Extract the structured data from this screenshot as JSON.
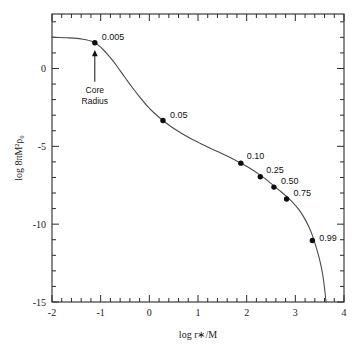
{
  "chart_data": {
    "type": "line",
    "title": "",
    "xlabel": "log r∗/M",
    "ylabel": "log 8πM²ρ₀",
    "xlim": [
      -2,
      4
    ],
    "ylim": [
      -15,
      3.5
    ],
    "grid": false,
    "legend": "none",
    "x_major_ticks": [
      -2,
      -1,
      0,
      1,
      2,
      3,
      4
    ],
    "x_major_tick_labels": [
      "-2",
      "-1",
      "0",
      "1",
      "2",
      "3",
      "4"
    ],
    "x_minor_subdivisions": 5,
    "y_major_ticks": [
      0,
      -5,
      -10,
      -15
    ],
    "y_major_tick_labels": [
      "0",
      "-5",
      "-10",
      "-15"
    ],
    "y_minor_subdivisions": 5,
    "curve_points": [
      [
        -2.0,
        2.0
      ],
      [
        -1.85,
        1.99
      ],
      [
        -1.7,
        1.97
      ],
      [
        -1.55,
        1.95
      ],
      [
        -1.4,
        1.9
      ],
      [
        -1.3,
        1.85
      ],
      [
        -1.2,
        1.76
      ],
      [
        -1.12,
        1.65
      ],
      [
        -1.05,
        1.5
      ],
      [
        -0.95,
        1.22
      ],
      [
        -0.85,
        0.88
      ],
      [
        -0.75,
        0.5
      ],
      [
        -0.65,
        0.08
      ],
      [
        -0.55,
        -0.36
      ],
      [
        -0.45,
        -0.8
      ],
      [
        -0.35,
        -1.22
      ],
      [
        -0.2,
        -1.82
      ],
      [
        -0.05,
        -2.38
      ],
      [
        0.1,
        -2.86
      ],
      [
        0.28,
        -3.34
      ],
      [
        0.45,
        -3.74
      ],
      [
        0.65,
        -4.14
      ],
      [
        0.85,
        -4.5
      ],
      [
        1.05,
        -4.82
      ],
      [
        1.25,
        -5.12
      ],
      [
        1.45,
        -5.4
      ],
      [
        1.65,
        -5.7
      ],
      [
        1.88,
        -6.08
      ],
      [
        2.05,
        -6.38
      ],
      [
        2.28,
        -6.85
      ],
      [
        2.45,
        -7.25
      ],
      [
        2.56,
        -7.55
      ],
      [
        2.7,
        -7.9
      ],
      [
        2.82,
        -8.22
      ],
      [
        2.95,
        -8.62
      ],
      [
        3.08,
        -9.1
      ],
      [
        3.18,
        -9.58
      ],
      [
        3.28,
        -10.18
      ],
      [
        3.35,
        -10.72
      ],
      [
        3.42,
        -11.4
      ],
      [
        3.5,
        -12.3
      ],
      [
        3.56,
        -13.2
      ],
      [
        3.6,
        -14.1
      ],
      [
        3.63,
        -15.0
      ]
    ],
    "points": [
      {
        "label": "0.005",
        "x": -1.12,
        "y": 1.65,
        "label_dx": 7,
        "label_dy": -3
      },
      {
        "label": "0.05",
        "x": 0.28,
        "y": -3.34,
        "label_dx": 7,
        "label_dy": -2
      },
      {
        "label": "0.10",
        "x": 1.88,
        "y": -6.08,
        "label_dx": 6,
        "label_dy": -4
      },
      {
        "label": "0.25",
        "x": 2.28,
        "y": -6.95,
        "label_dx": 6,
        "label_dy": -4
      },
      {
        "label": "0.50",
        "x": 2.56,
        "y": -7.62,
        "label_dx": 7,
        "label_dy": -3
      },
      {
        "label": "0.75",
        "x": 2.82,
        "y": -8.38,
        "label_dx": 7,
        "label_dy": -3
      },
      {
        "label": "0.99",
        "x": 3.35,
        "y": -11.05,
        "label_dx": 7,
        "label_dy": 0
      }
    ],
    "annotations": [
      {
        "name": "core-radius",
        "text_line1": "Core",
        "text_line2": "Radius",
        "arrow_tip_x": -1.12,
        "arrow_tip_y": 1.18,
        "arrow_tail_x": -1.12,
        "arrow_tail_y": -0.85,
        "text_x": -1.12,
        "text_y": -1.55
      }
    ]
  },
  "colors": {
    "axis": "#2b2b2b",
    "curve": "#4a4a4a",
    "marker": "#0d0d0d",
    "background": "#ffffff"
  }
}
